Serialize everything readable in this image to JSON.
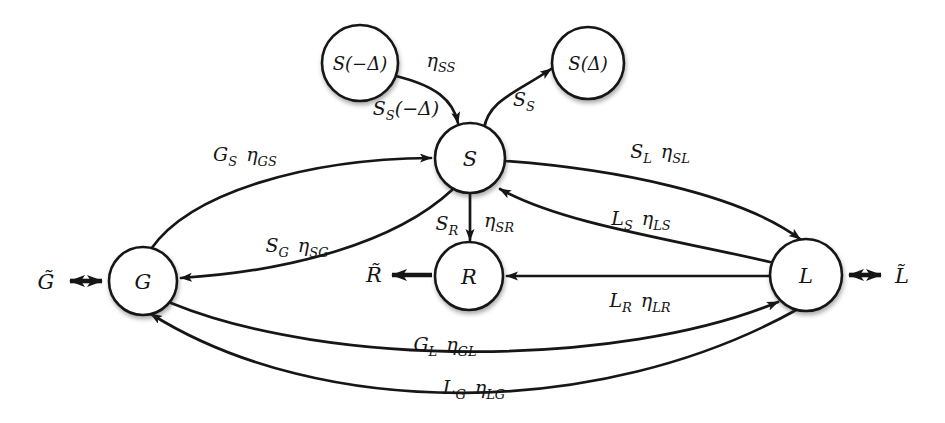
{
  "diagram": {
    "type": "flux-network-diagram",
    "colors": {
      "ink": "#161616",
      "background": "#ffffff",
      "node_fill": "#ffffff"
    },
    "nodes": {
      "s_minus": {
        "label": "S(−Δ)"
      },
      "s_plus": {
        "label": "S(Δ)"
      },
      "s": {
        "label": "S"
      },
      "g": {
        "label": "G"
      },
      "r": {
        "label": "R"
      },
      "l": {
        "label": "L"
      }
    },
    "external": {
      "g": {
        "label": "G̃"
      },
      "r": {
        "label": "R̃"
      },
      "l": {
        "label": "L̃"
      }
    },
    "edge_labels": {
      "eta_ss": {
        "a": "η",
        "a_sub": "SS"
      },
      "ss_minus": {
        "a": "S",
        "a_sub": "S",
        "post": "(−Δ)"
      },
      "ss": {
        "a": "S",
        "a_sub": "S"
      },
      "gs": {
        "a": "G",
        "a_sub": "S",
        "b": "η",
        "b_sub": "GS"
      },
      "sg": {
        "a": "S",
        "a_sub": "G",
        "b": "η",
        "b_sub": "SG"
      },
      "sl": {
        "a": "S",
        "a_sub": "L",
        "b": "η",
        "b_sub": "SL"
      },
      "ls": {
        "a": "L",
        "a_sub": "S",
        "b": "η",
        "b_sub": "LS"
      },
      "sr_flux": {
        "a": "S",
        "a_sub": "R"
      },
      "sr_eta": {
        "a": "η",
        "a_sub": "SR"
      },
      "lr": {
        "a": "L",
        "a_sub": "R",
        "b": "η",
        "b_sub": "LR"
      },
      "gl": {
        "a": "G",
        "a_sub": "L",
        "b": "η",
        "b_sub": "GL"
      },
      "lg": {
        "a": "L",
        "a_sub": "G",
        "b": "η",
        "b_sub": "LG"
      }
    }
  }
}
